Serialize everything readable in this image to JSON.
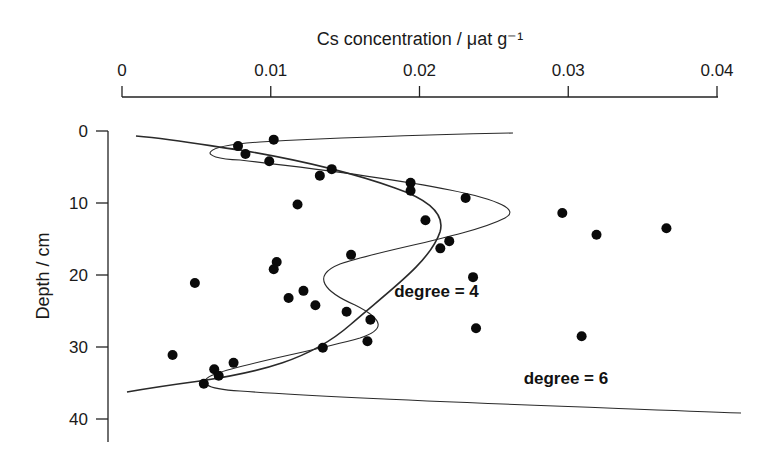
{
  "chart_data": {
    "type": "scatter",
    "title": "",
    "xlabel": "Cs concentration / μat g⁻¹",
    "ylabel": "Depth / cm",
    "x_axis_position": "top",
    "y_axis_inverted": true,
    "xlim": [
      0,
      0.04
    ],
    "ylim": [
      0,
      42
    ],
    "xticks": [
      0,
      0.01,
      0.02,
      0.03,
      0.04
    ],
    "xtick_labels": [
      "0",
      "0.01",
      "0.02",
      "0.03",
      "0.04"
    ],
    "yticks": [
      0,
      10,
      20,
      30,
      40
    ],
    "ytick_labels": [
      "0",
      "10",
      "20",
      "30",
      "40"
    ],
    "grid": false,
    "legend": null,
    "series": [
      {
        "name": "measured",
        "kind": "scatter",
        "points": [
          {
            "x": 0.0102,
            "y": 1.2
          },
          {
            "x": 0.0078,
            "y": 2.1
          },
          {
            "x": 0.0083,
            "y": 3.2
          },
          {
            "x": 0.0099,
            "y": 4.2
          },
          {
            "x": 0.0141,
            "y": 5.3
          },
          {
            "x": 0.0133,
            "y": 6.2
          },
          {
            "x": 0.0194,
            "y": 7.2
          },
          {
            "x": 0.0194,
            "y": 8.3
          },
          {
            "x": 0.0231,
            "y": 9.3
          },
          {
            "x": 0.0118,
            "y": 10.2
          },
          {
            "x": 0.0296,
            "y": 11.4
          },
          {
            "x": 0.0204,
            "y": 12.4
          },
          {
            "x": 0.0366,
            "y": 13.5
          },
          {
            "x": 0.0319,
            "y": 14.4
          },
          {
            "x": 0.022,
            "y": 15.3
          },
          {
            "x": 0.0214,
            "y": 16.3
          },
          {
            "x": 0.0154,
            "y": 17.2
          },
          {
            "x": 0.0104,
            "y": 18.2
          },
          {
            "x": 0.0102,
            "y": 19.2
          },
          {
            "x": 0.0236,
            "y": 20.3
          },
          {
            "x": 0.0049,
            "y": 21.1
          },
          {
            "x": 0.0122,
            "y": 22.2
          },
          {
            "x": 0.0112,
            "y": 23.2
          },
          {
            "x": 0.013,
            "y": 24.2
          },
          {
            "x": 0.0151,
            "y": 25.1
          },
          {
            "x": 0.0167,
            "y": 26.2
          },
          {
            "x": 0.0238,
            "y": 27.4
          },
          {
            "x": 0.0309,
            "y": 28.5
          },
          {
            "x": 0.0165,
            "y": 29.2
          },
          {
            "x": 0.0135,
            "y": 30.1
          },
          {
            "x": 0.0034,
            "y": 31.1
          },
          {
            "x": 0.0075,
            "y": 32.2
          },
          {
            "x": 0.0062,
            "y": 33.1
          },
          {
            "x": 0.0065,
            "y": 34.0
          },
          {
            "x": 0.0055,
            "y": 35.1
          }
        ]
      },
      {
        "name": "degree = 4",
        "kind": "fitted polynomial curve",
        "points": [
          {
            "x": 0.001,
            "y": 0.7
          },
          {
            "x": 0.008,
            "y": 2.0
          },
          {
            "x": 0.013,
            "y": 4.0
          },
          {
            "x": 0.0175,
            "y": 6.5
          },
          {
            "x": 0.02,
            "y": 9.5
          },
          {
            "x": 0.0214,
            "y": 12.0
          },
          {
            "x": 0.0205,
            "y": 15.5
          },
          {
            "x": 0.018,
            "y": 20.5
          },
          {
            "x": 0.0145,
            "y": 27.0
          },
          {
            "x": 0.01,
            "y": 31.5
          },
          {
            "x": 0.005,
            "y": 34.5
          },
          {
            "x": 0.0005,
            "y": 36.0
          }
        ]
      },
      {
        "name": "degree = 6",
        "kind": "fitted polynomial curve",
        "points": [
          {
            "x": 0.0263,
            "y": 0.3
          },
          {
            "x": 0.015,
            "y": 1.0
          },
          {
            "x": 0.0068,
            "y": 2.7
          },
          {
            "x": 0.011,
            "y": 4.5
          },
          {
            "x": 0.0195,
            "y": 7.5
          },
          {
            "x": 0.0263,
            "y": 10.9
          },
          {
            "x": 0.022,
            "y": 14.5
          },
          {
            "x": 0.014,
            "y": 18.5
          },
          {
            "x": 0.0138,
            "y": 21.0
          },
          {
            "x": 0.017,
            "y": 25.0
          },
          {
            "x": 0.016,
            "y": 28.5
          },
          {
            "x": 0.01,
            "y": 32.0
          },
          {
            "x": 0.0055,
            "y": 34.8
          },
          {
            "x": 0.015,
            "y": 36.5
          },
          {
            "x": 0.0416,
            "y": 39.0
          }
        ]
      }
    ],
    "annotations": [
      {
        "text": "degree = 4",
        "x": 0.0183,
        "y": 23.0
      },
      {
        "text": "degree = 6",
        "x": 0.027,
        "y": 35.2
      }
    ]
  }
}
